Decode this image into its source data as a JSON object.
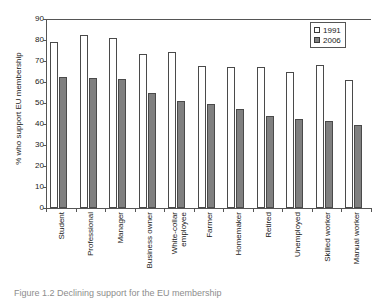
{
  "chart_data": {
    "type": "bar",
    "title": "",
    "xlabel": "",
    "ylabel": "% who support EU membership",
    "ylim": [
      0,
      90
    ],
    "yticks": [
      0,
      10,
      20,
      30,
      40,
      50,
      60,
      70,
      80,
      90
    ],
    "grid": false,
    "legend_position": "top-right",
    "categories": [
      "Student",
      "Professional",
      "Manager",
      "Business owner",
      "White-collar employee",
      "Farmer",
      "Homemaker",
      "Retired",
      "Unemployed",
      "Skilled worker",
      "Manual worker"
    ],
    "category_lines": [
      [
        "Student"
      ],
      [
        "Professional"
      ],
      [
        "Manager"
      ],
      [
        "Business owner"
      ],
      [
        "White-collar",
        "employee"
      ],
      [
        "Farmer"
      ],
      [
        "Homemaker"
      ],
      [
        "Retired"
      ],
      [
        "Unemployed"
      ],
      [
        "Skilled worker"
      ],
      [
        "Manual worker"
      ]
    ],
    "series": [
      {
        "name": "1991",
        "color": "#ffffff",
        "edge_color": "#4a4a4a",
        "values": [
          79,
          82.5,
          81,
          73.5,
          74.5,
          67.5,
          67,
          67,
          65,
          68,
          61
        ]
      },
      {
        "name": "2006",
        "color": "#808080",
        "edge_color": "#4a4a4a",
        "values": [
          62.5,
          62,
          61.5,
          55,
          51,
          49.5,
          47,
          44,
          42.5,
          41.5,
          39.5
        ]
      }
    ]
  },
  "legend": {
    "items": [
      {
        "label": "1991"
      },
      {
        "label": "2006"
      }
    ]
  },
  "caption": {
    "text": "Figure 1.2  Declining support for the EU membership"
  }
}
